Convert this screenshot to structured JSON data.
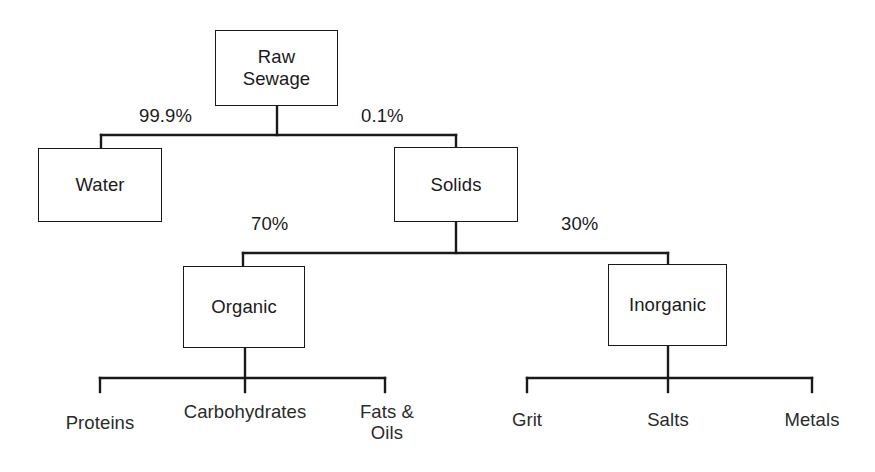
{
  "diagram": {
    "type": "hierarchy-tree",
    "line_color": "#1a1a1a",
    "text_color": "#1a1a1a",
    "background_color": "#ffffff",
    "nodes": {
      "raw_sewage": "Raw\nSewage",
      "water": "Water",
      "solids": "Solids",
      "organic": "Organic",
      "inorganic": "Inorganic"
    },
    "edge_labels": {
      "water_pct": "99.9%",
      "solids_pct": "0.1%",
      "organic_pct": "70%",
      "inorganic_pct": "30%"
    },
    "leaves": {
      "proteins": "Proteins",
      "carbohydrates": "Carbohydrates",
      "fats_oils": "Fats &\nOils",
      "grit": "Grit",
      "salts": "Salts",
      "metals": "Metals"
    }
  }
}
